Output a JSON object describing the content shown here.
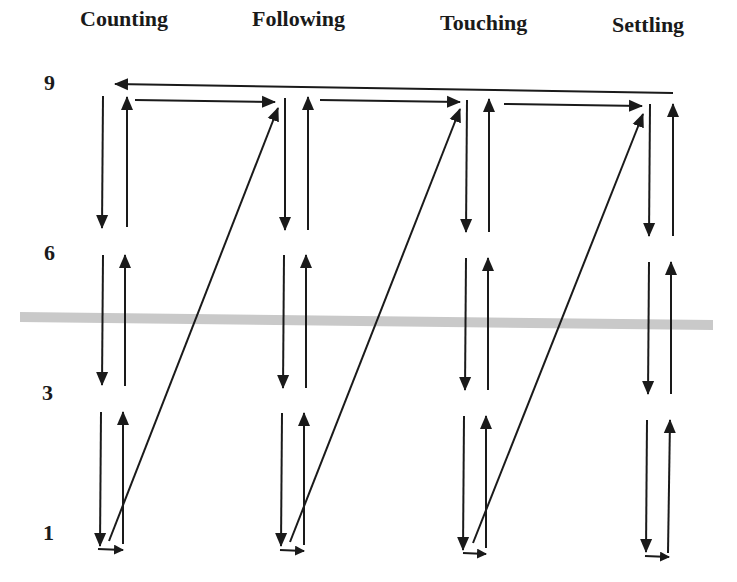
{
  "columns": [
    {
      "label": "Counting",
      "x": 80,
      "downX": 100,
      "upX": 125
    },
    {
      "label": "Following",
      "x": 252,
      "downX": 285,
      "upX": 308
    },
    {
      "label": "Touching",
      "x": 440,
      "downX": 465,
      "upX": 489
    },
    {
      "label": "Settling",
      "x": 612,
      "downX": 649,
      "upX": 673
    }
  ],
  "rows": [
    {
      "label": "9",
      "y": 72
    },
    {
      "label": "6",
      "y": 252
    },
    {
      "label": "3",
      "y": 392
    },
    {
      "label": "1",
      "y": 530
    }
  ],
  "band": {
    "color": "#c9c9c9",
    "y_left": 312,
    "y_right": 320,
    "x1": 20,
    "x2": 713
  },
  "ink_color": "#1a1a1a"
}
